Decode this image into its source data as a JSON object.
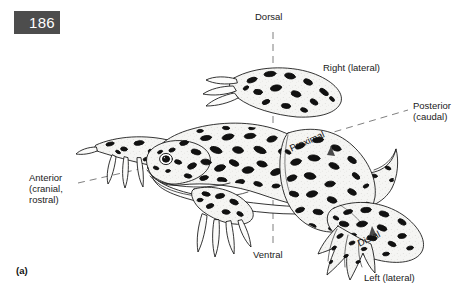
{
  "page": {
    "number": "186",
    "figure_letter": "(a)"
  },
  "figure": {
    "caption_labels": {
      "dorsal": "Dorsal",
      "ventral": "Ventral",
      "right_lateral": "Right (lateral)",
      "left_lateral": "Left (lateral)",
      "posterior": "Posterior\n(caudal)",
      "anterior": "Anterior\n(cranial,\nrostral)",
      "proximal": "Proximal",
      "distal": "Distal"
    }
  },
  "colors": {
    "badge_bg": "#4d4d4d",
    "badge_text": "#ffffff",
    "label_text": "#1a1a1a",
    "guide_line": "#6d6d6d",
    "ink": "#000000",
    "body_fill": "#f4f4f2",
    "belly_fill": "#ffffff",
    "page_bg": "#ffffff"
  }
}
